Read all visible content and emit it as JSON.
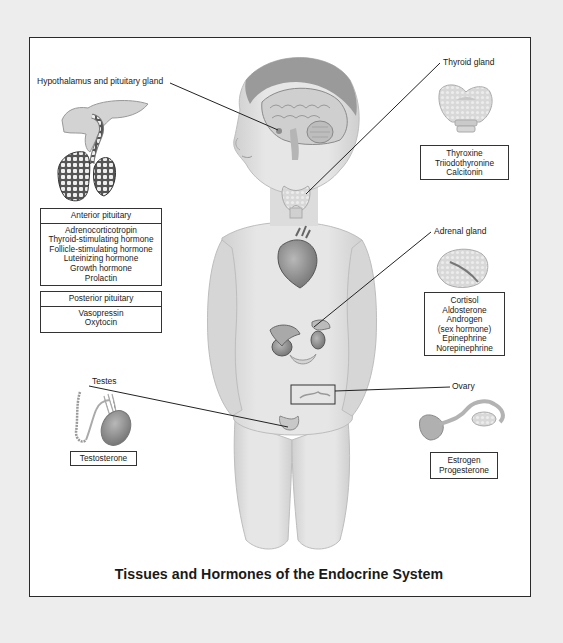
{
  "diagram": {
    "title": "Tissues and Hormones of the Endocrine System",
    "colors": {
      "page_background": "#ededed",
      "frame_background": "#ffffff",
      "border": "#2a2a2a",
      "skin": "#dcdcdc",
      "organ": "#9a9a9a"
    }
  },
  "callouts": {
    "hypothalamus": {
      "label": "Hypothalamus and pituitary gland"
    },
    "thyroid": {
      "label": "Thyroid gland"
    },
    "adrenal": {
      "label": "Adrenal gland"
    },
    "testes": {
      "label": "Testes"
    },
    "ovary": {
      "label": "Ovary"
    }
  },
  "hormone_boxes": {
    "anterior_pituitary": {
      "header": "Anterior pituitary",
      "items": [
        "Adrenocorticotropin",
        "Thyroid-stimulating hormone",
        "Follicle-stimulating hormone",
        "Luteinizing hormone",
        "Growth hormone",
        "Prolactin"
      ]
    },
    "posterior_pituitary": {
      "header": "Posterior pituitary",
      "items": [
        "Vasopressin",
        "Oxytocin"
      ]
    },
    "thyroid": {
      "items": [
        "Thyroxine",
        "Triiodothyronine",
        "Calcitonin"
      ]
    },
    "adrenal": {
      "items": [
        "Cortisol",
        "Aldosterone",
        "Androgen",
        "(sex hormone)",
        "Epinephrine",
        "Norepinephrine"
      ]
    },
    "testes": {
      "items": [
        "Testosterone"
      ]
    },
    "ovary": {
      "items": [
        "Estrogen",
        "Progesterone"
      ]
    }
  },
  "illustrations": {
    "body": "child-figure",
    "organs": [
      "brain",
      "pituitary",
      "thyroid",
      "heart",
      "adrenal-kidney",
      "ovary",
      "testes"
    ]
  }
}
